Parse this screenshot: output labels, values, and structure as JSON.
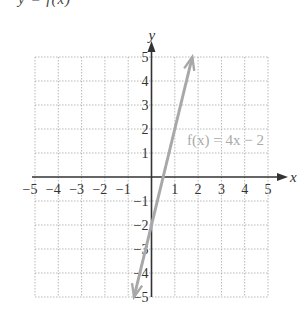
{
  "caption_fragment": "y = f(x)",
  "colors": {
    "axis": "#333333",
    "grid": "#b8b8b8",
    "line": "#a8a8a8",
    "label": "#aaaaaa"
  },
  "chart_data": {
    "type": "line",
    "title": "",
    "xlabel": "x",
    "ylabel": "y",
    "xlim": [
      -5,
      5
    ],
    "ylim": [
      -5,
      5
    ],
    "grid": true,
    "x_ticks": [
      "−5",
      "−4",
      "−3",
      "−2",
      "−1",
      "1",
      "2",
      "3",
      "4",
      "5"
    ],
    "y_ticks": [
      "5",
      "4",
      "3",
      "2",
      "1",
      "−1",
      "−2",
      "−3",
      "−4",
      "−5"
    ],
    "series": [
      {
        "name": "f(x) = 4x − 2",
        "equation": "f(x) = 4x − 2",
        "slope": 4,
        "intercept": -2,
        "x": [
          -0.75,
          1.75
        ],
        "y": [
          -5,
          5
        ],
        "arrows": "both"
      }
    ],
    "annotations": [
      {
        "text": "f(x) = 4x − 2",
        "x": 1.5,
        "y": 2.7
      }
    ]
  }
}
